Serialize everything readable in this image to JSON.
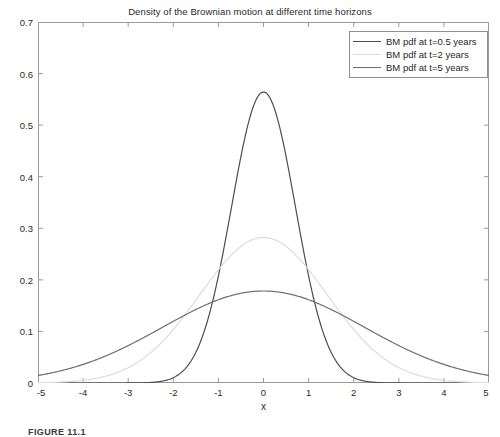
{
  "chart_data": {
    "type": "line",
    "title": "Density of the Brownian motion at different time horizons",
    "xlabel": "x",
    "ylabel": "",
    "xlim": [
      -5,
      5
    ],
    "ylim": [
      0,
      0.7
    ],
    "grid": false,
    "legend_position": "top-right",
    "xticks": [
      -5,
      -4,
      -3,
      -2,
      -1,
      0,
      1,
      2,
      3,
      4,
      5
    ],
    "xtick_labels": [
      "-5",
      "-4",
      "-3",
      "-2",
      "-1",
      "0",
      "1",
      "2",
      "3",
      "4",
      "5"
    ],
    "yticks": [
      0,
      0.1,
      0.2,
      0.3,
      0.4,
      0.5,
      0.6,
      0.7
    ],
    "ytick_labels": [
      "0",
      "0.1",
      "0.2",
      "0.3",
      "0.4",
      "0.5",
      "0.6",
      "0.7"
    ],
    "series": [
      {
        "name": "BM pdf at t=0.5 years",
        "t": 0.5,
        "color": "#4d4d4d",
        "peak_value": 0.5642,
        "x": [
          -5,
          -4.5,
          -4,
          -3.5,
          -3,
          -2.75,
          -2.5,
          -2.25,
          -2,
          -1.75,
          -1.5,
          -1.25,
          -1,
          -0.75,
          -0.5,
          -0.25,
          0,
          0.25,
          0.5,
          0.75,
          1,
          1.25,
          1.5,
          1.75,
          2,
          2.25,
          2.5,
          2.75,
          3,
          3.5,
          4,
          4.5,
          5
        ],
        "y": [
          0.0,
          0.0,
          0.0,
          0.0,
          0.0001,
          0.0003,
          0.0011,
          0.0033,
          0.0103,
          0.0283,
          0.0693,
          0.151,
          0.2926,
          0.5041,
          0.4839,
          0.5463,
          0.5642,
          0.5463,
          0.4839,
          0.391,
          0.2926,
          0.151,
          0.0693,
          0.0283,
          0.0103,
          0.0033,
          0.0011,
          0.0003,
          0.0001,
          0.0,
          0.0,
          0.0,
          0.0
        ]
      },
      {
        "name": "BM pdf at t=2 years",
        "t": 2,
        "color": "#dcdcdc",
        "peak_value": 0.2821,
        "x": [
          -5,
          -4.5,
          -4,
          -3.5,
          -3,
          -2.5,
          -2,
          -1.5,
          -1,
          -0.5,
          0,
          0.5,
          1,
          1.5,
          2,
          2.5,
          3,
          3.5,
          4,
          4.5,
          5
        ],
        "y": [
          0.0005,
          0.0017,
          0.0054,
          0.0147,
          0.0345,
          0.0699,
          0.121,
          0.1795,
          0.2197,
          0.2636,
          0.2821,
          0.2636,
          0.2197,
          0.1795,
          0.121,
          0.0699,
          0.0345,
          0.0147,
          0.0054,
          0.0017,
          0.0005
        ]
      },
      {
        "name": "BM pdf at t=5 years",
        "t": 5,
        "color": "#6e6e6e",
        "peak_value": 0.1784,
        "x": [
          -5,
          -4.5,
          -4,
          -3.5,
          -3,
          -2.5,
          -2,
          -1.5,
          -1,
          -0.5,
          0,
          0.5,
          1,
          1.5,
          2,
          2.5,
          3,
          3.5,
          4,
          4.5,
          5
        ],
        "y": [
          0.0147,
          0.0236,
          0.0359,
          0.0518,
          0.0709,
          0.092,
          0.1133,
          0.1323,
          0.1463,
          0.1561,
          0.1784,
          0.1561,
          0.1463,
          0.1323,
          0.1133,
          0.092,
          0.0709,
          0.0518,
          0.0359,
          0.0236,
          0.0147
        ]
      }
    ]
  },
  "legend": {
    "entries": [
      {
        "label": "BM pdf at t=0.5 years",
        "color": "#4d4d4d"
      },
      {
        "label": "BM pdf at t=2 years",
        "color": "#dcdcdc"
      },
      {
        "label": "BM pdf at t=5 years",
        "color": "#6e6e6e"
      }
    ]
  },
  "caption": "FIGURE 11.1"
}
